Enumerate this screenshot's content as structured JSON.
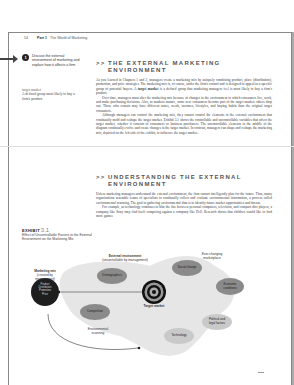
{
  "page": {
    "number": "54",
    "part_label": "Part 1",
    "part_title": "The World of Marketing"
  },
  "learning_objective": {
    "number": "1",
    "text": "Discuss the external environment of marketing and explain how it affects a firm"
  },
  "glossary": {
    "term": "target market",
    "definition": "A defined group most likely to buy a firm's product."
  },
  "exhibit": {
    "label": "EXHIBIT",
    "number": "3.1",
    "caption": "Effect of Uncontrollable Factors in the External Environment on the Marketing Mix"
  },
  "sections": [
    {
      "chevron": ">>",
      "title_line1": "THE EXTERNAL MARKETING",
      "title_line2": "ENVIRONMENT",
      "paragraphs": [
        {
          "before": "As you learned in Chapters 1 and 2, managers create a marketing mix by uniquely combining product, place (distribution), promotion, and price strategies. The marketing mix is, of course, under the firm's control and is designed to appeal to a specific group of potential buyers. A ",
          "bold": "target market",
          "after": " is a defined group that marketing managers feel is most likely to buy a firm's product."
        },
        {
          "text": "Over time, managers must alter the marketing mix because of changes in the environment in which consumers live, work, and make purchasing decisions. Also, as markets mature, some new consumers become part of the target market; others drop out. Those who remain may have different tastes, needs, incomes, lifestyles, and buying habits than the original target consumers."
        },
        {
          "text": "Although managers can control the marketing mix, they cannot control the elements in the external environment that continually mold and reshape the target market. Exhibit 3.1 shows the controllable and uncontrollable variables that affect the target market, whether it consists of consumers or business purchasers. The uncontrollable elements in the middle of the diagram continually evolve and create changes in the target market. In contrast, managers can shape and reshape the marketing mix, depicted on the left side of the exhibit, to influence the target market."
        }
      ]
    },
    {
      "chevron": ">>",
      "title_line1": "UNDERSTANDING THE EXTERNAL",
      "title_line2": "ENVIRONMENT",
      "paragraphs": [
        {
          "text": "Unless marketing managers understand the external environment, the firm cannot intelligently plan for the future. Thus, many organizations assemble teams of specialists to continually collect and evaluate environmental information, a process called environmental scanning. The goal in gathering environmental data is to identify future market opportunities and threats."
        },
        {
          "text": "For example, as technology continues to blur the line between personal computers, television, and compact disc players, a company like Sony may find itself competing against a company like Dell. Research shows that children would like to find more games"
        }
      ]
    }
  ],
  "diagram": {
    "external_env_title": "External environment",
    "external_env_sub": "(uncontrollable by management)",
    "marketing_mix_title": "Marketing mix",
    "marketing_mix_sub1": "(created by",
    "marketing_mix_sub2": "management)",
    "mix_items": [
      "Product",
      "Distribution",
      "Promotion",
      "Price"
    ],
    "ever_changing_1": "Ever-changing",
    "ever_changing_2": "marketplace",
    "factors": {
      "social": "Social change",
      "demographics": "Demographics",
      "economic_1": "Economic",
      "economic_2": "conditions",
      "competition": "Competition",
      "political_1": "Political and",
      "political_2": "legal factors",
      "technology": "Technology"
    },
    "target_market": "Target market",
    "env_scanning_1": "Environmental",
    "env_scanning_2": "scanning"
  }
}
